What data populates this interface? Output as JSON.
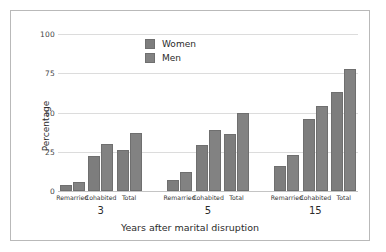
{
  "chart_data": {
    "type": "bar",
    "title": "",
    "xlabel": "Years after marital disruption",
    "ylabel": "Percentage",
    "ylim": [
      0,
      100
    ],
    "yticks": [
      0,
      25,
      50,
      75,
      100
    ],
    "ytick_labels": [
      "0",
      "25",
      "50",
      "75",
      "100"
    ],
    "grid": true,
    "legend_position": "upper center",
    "group_label_field": "Years after marital disruption",
    "groups": [
      {
        "group": "3",
        "categories": [
          "Remarried",
          "Cohabited",
          "Total"
        ],
        "women": [
          4,
          22,
          26
        ],
        "men": [
          6,
          30,
          37
        ]
      },
      {
        "group": "5",
        "categories": [
          "Remarried",
          "Cohabited",
          "Total"
        ],
        "women": [
          7,
          29,
          36
        ],
        "men": [
          12,
          39,
          50
        ]
      },
      {
        "group": "15",
        "categories": [
          "Remarried",
          "Cohabited",
          "Total"
        ],
        "women": [
          16,
          46,
          63
        ],
        "men": [
          23,
          54,
          78
        ]
      }
    ],
    "series": [
      {
        "name": "Women",
        "color": "#7d7d7d",
        "values": [
          4,
          22,
          26,
          7,
          29,
          36,
          16,
          46,
          63
        ]
      },
      {
        "name": "Men",
        "color": "#828282",
        "values": [
          6,
          30,
          37,
          12,
          39,
          50,
          23,
          54,
          78
        ]
      }
    ],
    "categories": [
      "Remarried",
      "Cohabited",
      "Total",
      "Remarried",
      "Cohabited",
      "Total",
      "Remarried",
      "Cohabited",
      "Total"
    ],
    "group_labels": [
      "3",
      "5",
      "15"
    ]
  },
  "legend": {
    "items": [
      {
        "label": "Women",
        "color": "#7d7d7d"
      },
      {
        "label": "Men",
        "color": "#828282"
      }
    ]
  },
  "colors": {
    "women": "#7d7d7d",
    "men": "#828282",
    "grid": "#dcdcdc",
    "axis": "#c4c4c4",
    "frame": "#b9b9b9",
    "text": "#2b2b2b",
    "background": "#ffffff"
  }
}
